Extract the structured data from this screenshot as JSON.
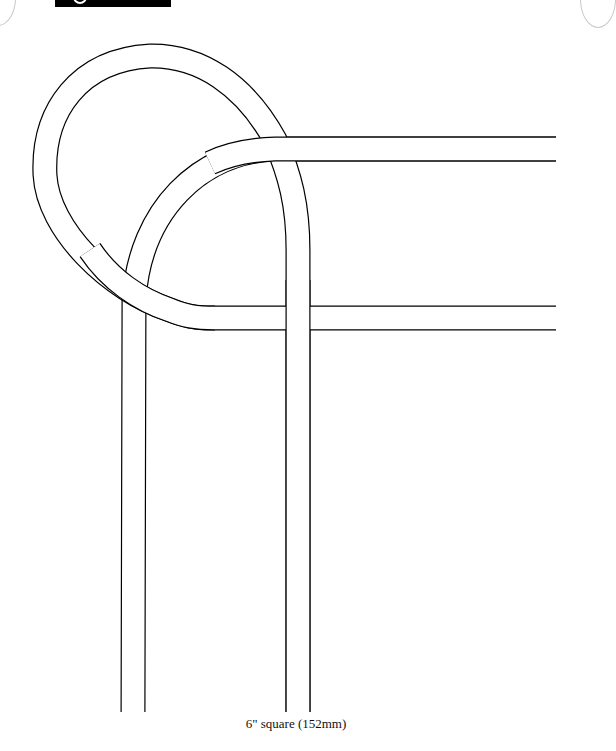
{
  "header": {
    "tab_icon": "circle-logo-icon"
  },
  "diagram": {
    "type": "celtic-knot-quilting-pattern-corner",
    "line_color": "#000000",
    "fill_color": "#ffffff",
    "band_width_px": 24
  },
  "caption": {
    "text": "6\" square (152mm)"
  }
}
